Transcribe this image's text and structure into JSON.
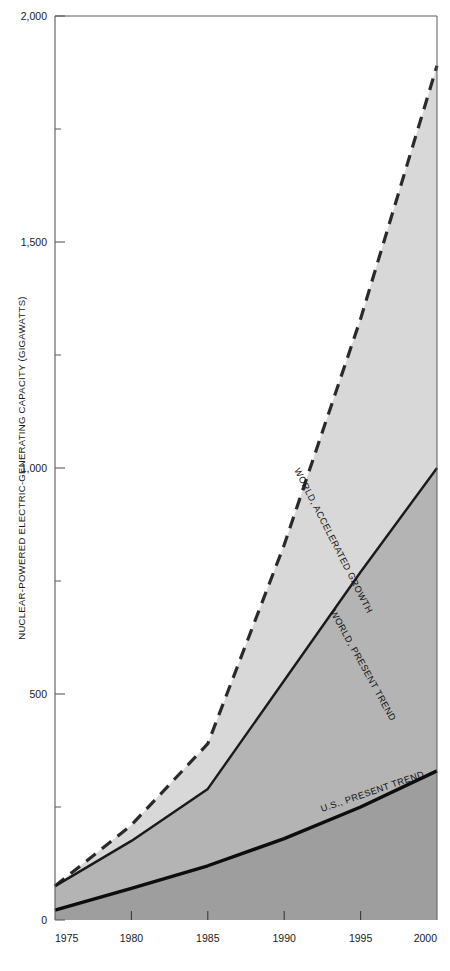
{
  "chart_data": {
    "type": "area",
    "title": "",
    "subtitle": "",
    "xlabel": "",
    "ylabel": "NUCLEAR-POWERED ELECTRIC-GENERATING CAPACITY (GIGAWATTS)",
    "xlim": [
      1975,
      2000
    ],
    "ylim": [
      0,
      2000
    ],
    "grid": false,
    "legend_position": "inline-annotations",
    "x_ticks": [
      1975,
      1980,
      1985,
      1990,
      1995,
      2000
    ],
    "x_tick_labels": [
      "1975",
      "1980",
      "1985",
      "1990",
      "1995",
      "2000"
    ],
    "y_ticks": [
      0,
      250,
      500,
      750,
      1000,
      1250,
      1500,
      1750,
      2000
    ],
    "y_tick_labels": [
      "0",
      "",
      "500",
      "",
      "1,000",
      "",
      "1,500",
      "",
      "2,000"
    ],
    "y_major_ticks": [
      0,
      500,
      1000,
      1500,
      2000
    ],
    "x": [
      1975,
      1980,
      1985,
      1990,
      1995,
      2000
    ],
    "series": [
      {
        "name": "WORLD, ACCELERATED GROWTH",
        "label": "WORLD, ACCELERATED GROWTH",
        "style": "dashed",
        "color": "#2a2a2a",
        "fill": "#d8d8d8",
        "values": [
          75,
          210,
          390,
          830,
          1330,
          1890
        ]
      },
      {
        "name": "WORLD, PRESENT TREND",
        "label": "WORLD, PRESENT TREND",
        "style": "solid",
        "color": "#1a1a1a",
        "fill": "#b4b4b4",
        "values": [
          75,
          175,
          290,
          530,
          770,
          1000
        ]
      },
      {
        "name": "U.S., PRESENT TREND",
        "label": "U.S., PRESENT TREND",
        "style": "solid-thick",
        "color": "#0d0d0d",
        "fill": "#9e9e9e",
        "values": [
          22,
          70,
          120,
          180,
          250,
          330
        ]
      }
    ],
    "annotations": [
      {
        "text": "WORLD, ACCELERATED GROWTH",
        "series": "WORLD, ACCELERATED GROWTH"
      },
      {
        "text": "WORLD, PRESENT TREND",
        "series": "WORLD, PRESENT TREND"
      },
      {
        "text": "U.S., PRESENT TREND",
        "series": "U.S., PRESENT TREND"
      }
    ],
    "colors": {
      "band_accelerated": "#d8d8d8",
      "band_world": "#b4b4b4",
      "band_us": "#9e9e9e",
      "axis": "#5a5a5a",
      "line_dark": "#1a1a1a",
      "background": "#ffffff"
    }
  }
}
